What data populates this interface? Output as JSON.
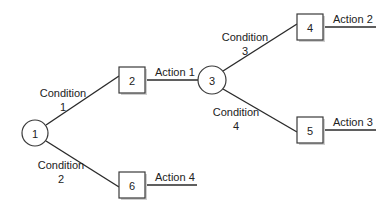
{
  "diagram": {
    "type": "decision-tree",
    "colors": {
      "line": "#2a2a2a",
      "node_stroke": "#3a3a3a",
      "node_fill": "#ffffff",
      "shadow": "#cfcfcf",
      "text": "#222222"
    },
    "nodes": [
      {
        "id": "1",
        "shape": "circle",
        "label": "1"
      },
      {
        "id": "2",
        "shape": "box",
        "label": "2"
      },
      {
        "id": "3",
        "shape": "circle",
        "label": "3"
      },
      {
        "id": "4",
        "shape": "box",
        "label": "4"
      },
      {
        "id": "5",
        "shape": "box",
        "label": "5"
      },
      {
        "id": "6",
        "shape": "box",
        "label": "6"
      }
    ],
    "edges": [
      {
        "from": "1",
        "to": "2",
        "label_line1": "Condition",
        "label_line2": "1"
      },
      {
        "from": "1",
        "to": "6",
        "label_line1": "Condition",
        "label_line2": "2"
      },
      {
        "from": "2",
        "to": "3",
        "label": "Action 1"
      },
      {
        "from": "3",
        "to": "4",
        "label_line1": "Condition",
        "label_line2": "3"
      },
      {
        "from": "3",
        "to": "5",
        "label_line1": "Condition",
        "label_line2": "4"
      }
    ],
    "terminal_actions": [
      {
        "from": "4",
        "label": "Action 2"
      },
      {
        "from": "5",
        "label": "Action 3"
      },
      {
        "from": "6",
        "label": "Action 4"
      }
    ]
  }
}
